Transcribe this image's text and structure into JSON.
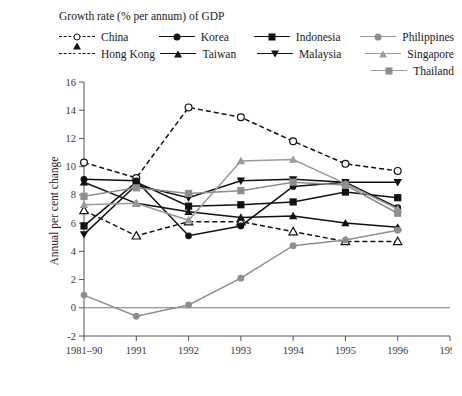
{
  "legend": {
    "title": "Growth rate (% per annum) of GDP",
    "items": [
      {
        "label": "China",
        "marker": "circle-open",
        "line": "dashed",
        "color": "#111111"
      },
      {
        "label": "Hong Kong",
        "marker": "triangle-open",
        "line": "dashed",
        "color": "#111111"
      },
      {
        "label": "Korea",
        "marker": "circle",
        "line": "solid",
        "color": "#111111"
      },
      {
        "label": "Taiwan",
        "marker": "triangle-up",
        "line": "solid",
        "color": "#111111"
      },
      {
        "label": "Indonesia",
        "marker": "square",
        "line": "solid",
        "color": "#111111"
      },
      {
        "label": "Malaysia",
        "marker": "triangle-down",
        "line": "solid",
        "color": "#111111"
      },
      {
        "label": "Philippines",
        "marker": "circle",
        "line": "solid",
        "color": "#8e8e8e"
      },
      {
        "label": "Singapore",
        "marker": "triangle-up",
        "line": "solid",
        "color": "#9a9a9a"
      },
      {
        "label": "Thailand",
        "marker": "square",
        "line": "solid",
        "color": "#8e8e8e"
      }
    ]
  },
  "axes": {
    "ylabel": "Annual per cent change",
    "yticks": [
      16,
      14,
      12,
      10,
      8,
      6,
      4,
      2,
      0,
      -2
    ],
    "xticks": [
      "1981–90",
      "1991",
      "1992",
      "1993",
      "1994",
      "1995",
      "1996",
      "1997"
    ]
  },
  "chart_data": {
    "type": "line",
    "title": "Growth rate (% per annum) of GDP",
    "xlabel": "",
    "ylabel": "Annual per cent change",
    "categories": [
      "1981–90",
      "1991",
      "1992",
      "1993",
      "1994",
      "1995",
      "1996",
      "1997"
    ],
    "ylim": [
      -2,
      16
    ],
    "grid": false,
    "legend_position": "top",
    "series": [
      {
        "name": "China",
        "values": [
          10.3,
          9.2,
          14.2,
          13.5,
          11.8,
          10.2,
          9.7,
          null
        ]
      },
      {
        "name": "Hong Kong",
        "values": [
          6.9,
          5.1,
          6.1,
          6.1,
          5.4,
          4.7,
          4.7,
          null
        ]
      },
      {
        "name": "Korea",
        "values": [
          9.1,
          9.0,
          5.1,
          5.8,
          8.6,
          8.9,
          7.1,
          null
        ]
      },
      {
        "name": "Taiwan",
        "values": [
          8.9,
          7.4,
          6.8,
          6.4,
          6.5,
          6.0,
          5.7,
          null
        ]
      },
      {
        "name": "Indonesia",
        "values": [
          5.8,
          8.9,
          7.2,
          7.3,
          7.5,
          8.2,
          7.8,
          null
        ]
      },
      {
        "name": "Malaysia",
        "values": [
          5.2,
          8.7,
          7.8,
          9.0,
          9.1,
          8.9,
          8.9,
          null
        ]
      },
      {
        "name": "Philippines",
        "values": [
          0.9,
          -0.6,
          0.2,
          2.1,
          4.4,
          4.8,
          5.5,
          null
        ]
      },
      {
        "name": "Singapore",
        "values": [
          7.3,
          7.4,
          6.2,
          10.4,
          10.5,
          8.8,
          7.0,
          null
        ]
      },
      {
        "name": "Thailand",
        "values": [
          7.9,
          8.5,
          8.1,
          8.3,
          8.9,
          8.7,
          6.7,
          null
        ]
      }
    ]
  }
}
